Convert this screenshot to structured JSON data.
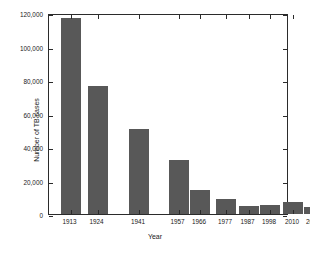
{
  "chart_data": {
    "type": "bar",
    "title": "",
    "xlabel": "Year",
    "ylabel": "Number of TB cases",
    "categories": [
      "1913",
      "1924",
      "1941",
      "1957",
      "1966",
      "1977",
      "1987",
      "1998",
      "2010",
      "2019"
    ],
    "values": [
      117000,
      76500,
      51000,
      32500,
      14200,
      9000,
      4500,
      5300,
      7000,
      4000
    ],
    "ylim": [
      0,
      120000
    ],
    "yticks": [
      0,
      20000,
      40000,
      60000,
      80000,
      100000,
      120000
    ],
    "ytick_labels": [
      "0",
      "20,000",
      "40,000",
      "60,000",
      "80,000",
      "100,000",
      "120,000"
    ],
    "grid": false,
    "legend": "none",
    "bar_color": "#585858",
    "axis_color": "#2b2b2b",
    "background": "#ffffff",
    "bar_positions_pct": [
      13.3,
      24.2,
      41.2,
      57.5,
      66.2,
      77.0,
      86.2,
      95.0,
      104.5,
      113.0
    ]
  },
  "axes": {
    "x_title": "Year",
    "y_title": "Number of TB cases"
  }
}
